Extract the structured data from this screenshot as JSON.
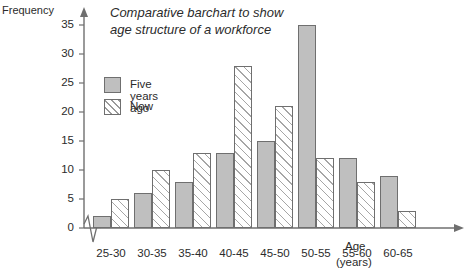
{
  "chart_data": {
    "type": "bar",
    "title": "Comparative barchart to show age structure of a workforce",
    "title_lines": [
      "Comparative barchart to show",
      "age structure of a workforce"
    ],
    "xlabel": "Age",
    "xlabel_unit": "(years)",
    "ylabel": "Frequency",
    "categories": [
      "25-30",
      "30-35",
      "35-40",
      "40-45",
      "45-50",
      "50-55",
      "55-60",
      "60-65"
    ],
    "series": [
      {
        "name": "Five years ago",
        "values": [
          2,
          6,
          8,
          13,
          15,
          35,
          12,
          9
        ],
        "fill": "#bfbfbf",
        "pattern": "solid"
      },
      {
        "name": "Now",
        "values": [
          5,
          10,
          13,
          28,
          21,
          12,
          8,
          3
        ],
        "fill": "#ffffff",
        "pattern": "diagonal-hatch"
      }
    ],
    "ylim": [
      0,
      35
    ],
    "yticks": [
      0,
      5,
      10,
      15,
      20,
      25,
      30,
      35
    ],
    "ytick_labels": [
      "0",
      "5",
      "10",
      "15",
      "20",
      "25",
      "30",
      "35"
    ],
    "grid": false,
    "legend_position": "top-left-inside",
    "axis_break": "zigzag-at-origin",
    "axis_color": "#6f6f6f"
  }
}
